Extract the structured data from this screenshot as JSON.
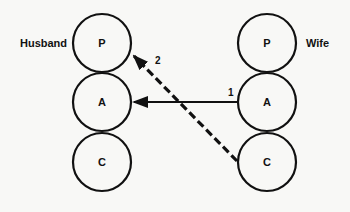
{
  "diagram": {
    "left_label": "Husband",
    "right_label": "Wife",
    "left_states": [
      "P",
      "A",
      "C"
    ],
    "right_states": [
      "P",
      "A",
      "C"
    ],
    "transactions": [
      {
        "label": "1",
        "from": "Wife A",
        "to": "Husband A",
        "style": "solid"
      },
      {
        "label": "2",
        "from": "Wife C",
        "to": "Husband P",
        "style": "dashed"
      }
    ]
  }
}
